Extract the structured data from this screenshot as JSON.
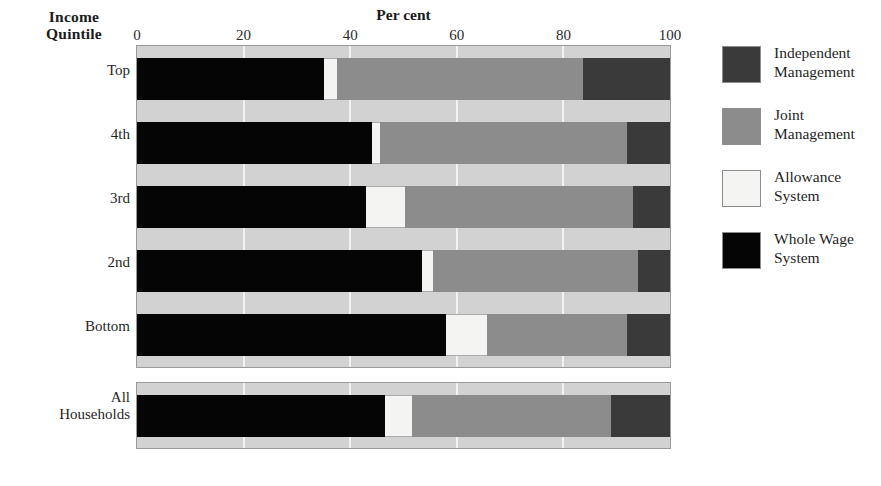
{
  "chart_data": {
    "type": "bar",
    "subtype": "horizontal-stacked-100",
    "title": "",
    "xlabel": "Per cent",
    "ylabel": "Income Quintile",
    "xlim": [
      0,
      100
    ],
    "xticks": [
      0,
      20,
      40,
      60,
      80,
      100
    ],
    "grid": true,
    "legend_position": "right",
    "stack_order": [
      "Whole Wage System",
      "Allowance System",
      "Joint Management",
      "Independent Management"
    ],
    "categories": [
      "Top",
      "4th",
      "3rd",
      "2nd",
      "Bottom",
      "All Households"
    ],
    "series": [
      {
        "name": "Whole Wage System",
        "color": "#050505",
        "values": [
          35.0,
          44.0,
          43.0,
          53.5,
          58.0,
          46.5
        ]
      },
      {
        "name": "Allowance System",
        "color": "#f4f4f2",
        "values": [
          2.5,
          1.6,
          7.3,
          2.0,
          7.7,
          5.1
        ]
      },
      {
        "name": "Joint Management",
        "color": "#8c8c8c",
        "values": [
          46.2,
          46.4,
          42.7,
          38.5,
          26.3,
          37.4
        ]
      },
      {
        "name": "Independent Management",
        "color": "#3a3a3a",
        "values": [
          16.3,
          8.0,
          7.0,
          6.0,
          8.0,
          11.0
        ]
      }
    ]
  },
  "axes": {
    "y_title_line1": "Income",
    "y_title_line2": "Quintile",
    "x_title": "Per cent",
    "x_tick_labels": [
      "0",
      "20",
      "40",
      "60",
      "80",
      "100"
    ]
  },
  "category_labels": [
    {
      "line1": "Top",
      "line2": ""
    },
    {
      "line1": "4th",
      "line2": ""
    },
    {
      "line1": "3rd",
      "line2": ""
    },
    {
      "line1": "2nd",
      "line2": ""
    },
    {
      "line1": "Bottom",
      "line2": ""
    },
    {
      "line1": "All",
      "line2": "Households"
    }
  ],
  "legend": {
    "items": [
      {
        "line1": "Independent",
        "line2": "Management",
        "color": "#3a3a3a"
      },
      {
        "line1": "Joint",
        "line2": "Management",
        "color": "#8c8c8c"
      },
      {
        "line1": "Allowance",
        "line2": "System",
        "color": "#f4f4f2"
      },
      {
        "line1": "Whole Wage",
        "line2": "System",
        "color": "#050505"
      }
    ]
  }
}
